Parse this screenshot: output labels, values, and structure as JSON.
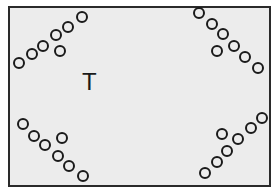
{
  "diagram": {
    "center_label": "T",
    "colors": {
      "frame_border": "#2a2a2a",
      "frame_fill": "#ececec",
      "circle_stroke": "#1a1a1a"
    },
    "circle_radius": 6,
    "groups": [
      {
        "name": "top-left",
        "circles": [
          [
            19,
            63
          ],
          [
            32,
            54
          ],
          [
            43,
            46
          ],
          [
            56,
            35
          ],
          [
            68,
            27
          ],
          [
            82,
            17
          ],
          [
            60,
            51
          ]
        ]
      },
      {
        "name": "top-right",
        "circles": [
          [
            199,
            13
          ],
          [
            212,
            24
          ],
          [
            223,
            34
          ],
          [
            234,
            46
          ],
          [
            245,
            57
          ],
          [
            258,
            68
          ],
          [
            217,
            51
          ]
        ]
      },
      {
        "name": "bottom-left",
        "circles": [
          [
            23,
            124
          ],
          [
            34,
            136
          ],
          [
            45,
            145
          ],
          [
            58,
            156
          ],
          [
            69,
            166
          ],
          [
            83,
            176
          ],
          [
            62,
            138
          ]
        ]
      },
      {
        "name": "bottom-right",
        "circles": [
          [
            205,
            173
          ],
          [
            217,
            162
          ],
          [
            227,
            151
          ],
          [
            238,
            139
          ],
          [
            251,
            128
          ],
          [
            262,
            118
          ],
          [
            222,
            134
          ]
        ]
      }
    ]
  }
}
